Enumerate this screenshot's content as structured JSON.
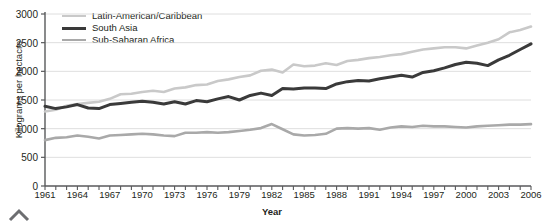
{
  "chart_data": {
    "type": "line",
    "title": "",
    "xlabel": "Year",
    "ylabel": "Kilograms per hectacre",
    "xlim": [
      1961,
      2006
    ],
    "ylim": [
      0,
      3000
    ],
    "grid": true,
    "legend_position": "top-left",
    "ytick_labels": [
      "0",
      "500",
      "1000",
      "1500",
      "2000",
      "2500",
      "3000"
    ],
    "ytick_values": [
      0,
      500,
      1000,
      1500,
      2000,
      2500,
      3000
    ],
    "xtick_labels": [
      "1961",
      "1964",
      "1967",
      "1970",
      "1973",
      "1976",
      "1979",
      "1982",
      "1985",
      "1988",
      "1991",
      "1994",
      "1997",
      "2000",
      "2003",
      "2006"
    ],
    "xtick_values": [
      1961,
      1964,
      1967,
      1970,
      1973,
      1976,
      1979,
      1982,
      1985,
      1988,
      1991,
      1994,
      1997,
      2000,
      2003,
      2006
    ],
    "x": [
      1961,
      1962,
      1963,
      1964,
      1965,
      1966,
      1967,
      1968,
      1969,
      1970,
      1971,
      1972,
      1973,
      1974,
      1975,
      1976,
      1977,
      1978,
      1979,
      1980,
      1981,
      1982,
      1983,
      1984,
      1985,
      1986,
      1987,
      1988,
      1989,
      1990,
      1991,
      1992,
      1993,
      1994,
      1995,
      1996,
      1997,
      1998,
      1999,
      2000,
      2001,
      2002,
      2003,
      2004,
      2005,
      2006
    ],
    "series": [
      {
        "name": "Latin-American/Caribbean",
        "color": "#c9c9c9",
        "width": 2.6,
        "values": [
          1300,
          1330,
          1400,
          1430,
          1450,
          1470,
          1520,
          1600,
          1610,
          1640,
          1660,
          1640,
          1700,
          1720,
          1760,
          1770,
          1830,
          1860,
          1900,
          1930,
          2010,
          2030,
          1980,
          2120,
          2090,
          2100,
          2140,
          2110,
          2180,
          2200,
          2230,
          2250,
          2280,
          2300,
          2340,
          2380,
          2400,
          2420,
          2420,
          2400,
          2450,
          2500,
          2560,
          2680,
          2720,
          2780
        ]
      },
      {
        "name": "South Asia",
        "color": "#3a3a3a",
        "width": 3.0,
        "values": [
          1390,
          1350,
          1380,
          1420,
          1360,
          1350,
          1420,
          1440,
          1460,
          1480,
          1460,
          1430,
          1470,
          1430,
          1490,
          1470,
          1520,
          1560,
          1500,
          1580,
          1620,
          1580,
          1700,
          1690,
          1710,
          1710,
          1700,
          1780,
          1820,
          1840,
          1830,
          1870,
          1900,
          1930,
          1900,
          1980,
          2010,
          2060,
          2120,
          2160,
          2140,
          2100,
          2200,
          2280,
          2380,
          2480
        ]
      },
      {
        "name": "Sub-Saharan Africa",
        "color": "#a9a9a9",
        "width": 2.6,
        "values": [
          800,
          840,
          850,
          880,
          860,
          830,
          880,
          890,
          900,
          910,
          900,
          880,
          870,
          930,
          930,
          940,
          930,
          940,
          960,
          980,
          1010,
          1080,
          990,
          900,
          880,
          890,
          910,
          1000,
          1010,
          1000,
          1010,
          980,
          1020,
          1040,
          1030,
          1050,
          1040,
          1040,
          1030,
          1020,
          1040,
          1050,
          1060,
          1070,
          1070,
          1080
        ]
      }
    ]
  }
}
